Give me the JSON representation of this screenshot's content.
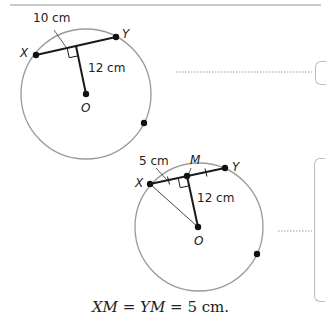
{
  "figure1": {
    "chord_length_label": "10 cm",
    "distance_label": "12 cm",
    "point_x": "X",
    "point_y": "Y",
    "center": "O"
  },
  "figure2": {
    "half_chord_label": "5 cm",
    "distance_label": "12 cm",
    "point_x": "X",
    "point_y": "Y",
    "midpoint": "M",
    "center": "O"
  },
  "caption": {
    "lhs": "XM",
    "eq1": " = ",
    "mid": "YM",
    "eq2": " = ",
    "value": "5 cm."
  },
  "colors": {
    "circle": "#9a9a9a",
    "segment": "#1a1a1a",
    "dotted": "#9a9a9a",
    "box_border": "#bdbdbd"
  }
}
